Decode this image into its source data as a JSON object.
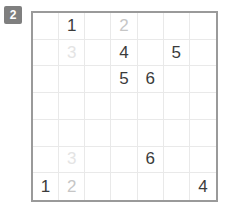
{
  "badge": {
    "label": "2",
    "background_color": "#7f7f7f",
    "text_color": "#ffffff"
  },
  "grid": {
    "rows": 7,
    "columns": 7,
    "border_color": "#9a9a9a",
    "line_color": "#e9e9e9",
    "background_color": "#ffffff",
    "digit_colors": {
      "dark": "#3b3b3b",
      "mid": "#c6c6c6",
      "faint": "#e4e4e4"
    },
    "cells": [
      [
        {
          "value": "",
          "tone": "empty"
        },
        {
          "value": "1",
          "tone": "dark"
        },
        {
          "value": "",
          "tone": "empty"
        },
        {
          "value": "2",
          "tone": "mid"
        },
        {
          "value": "",
          "tone": "empty"
        },
        {
          "value": "",
          "tone": "empty"
        },
        {
          "value": "",
          "tone": "empty"
        }
      ],
      [
        {
          "value": "",
          "tone": "empty"
        },
        {
          "value": "3",
          "tone": "faint"
        },
        {
          "value": "",
          "tone": "empty"
        },
        {
          "value": "4",
          "tone": "dark"
        },
        {
          "value": "",
          "tone": "empty"
        },
        {
          "value": "5",
          "tone": "dark"
        },
        {
          "value": "",
          "tone": "empty"
        }
      ],
      [
        {
          "value": "",
          "tone": "empty"
        },
        {
          "value": "",
          "tone": "empty"
        },
        {
          "value": "",
          "tone": "empty"
        },
        {
          "value": "5",
          "tone": "dark"
        },
        {
          "value": "6",
          "tone": "dark"
        },
        {
          "value": "",
          "tone": "empty"
        },
        {
          "value": "",
          "tone": "empty"
        }
      ],
      [
        {
          "value": "",
          "tone": "empty"
        },
        {
          "value": "",
          "tone": "empty"
        },
        {
          "value": "",
          "tone": "empty"
        },
        {
          "value": "",
          "tone": "empty"
        },
        {
          "value": "",
          "tone": "empty"
        },
        {
          "value": "",
          "tone": "empty"
        },
        {
          "value": "",
          "tone": "empty"
        }
      ],
      [
        {
          "value": "",
          "tone": "empty"
        },
        {
          "value": "",
          "tone": "empty"
        },
        {
          "value": "",
          "tone": "empty"
        },
        {
          "value": "",
          "tone": "empty"
        },
        {
          "value": "",
          "tone": "empty"
        },
        {
          "value": "",
          "tone": "empty"
        },
        {
          "value": "",
          "tone": "empty"
        }
      ],
      [
        {
          "value": "",
          "tone": "empty"
        },
        {
          "value": "3",
          "tone": "faint"
        },
        {
          "value": "",
          "tone": "empty"
        },
        {
          "value": "",
          "tone": "empty"
        },
        {
          "value": "6",
          "tone": "dark"
        },
        {
          "value": "",
          "tone": "empty"
        },
        {
          "value": "",
          "tone": "empty"
        }
      ],
      [
        {
          "value": "1",
          "tone": "dark"
        },
        {
          "value": "2",
          "tone": "mid"
        },
        {
          "value": "",
          "tone": "empty"
        },
        {
          "value": "",
          "tone": "empty"
        },
        {
          "value": "",
          "tone": "empty"
        },
        {
          "value": "",
          "tone": "empty"
        },
        {
          "value": "4",
          "tone": "dark"
        }
      ]
    ]
  }
}
